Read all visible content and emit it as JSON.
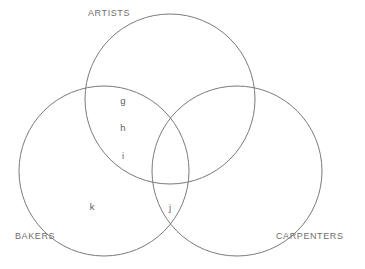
{
  "diagram": {
    "type": "venn-3-set",
    "background_color": "#ffffff",
    "stroke_color": "#7a7a7a",
    "label_color": "#6f6f6f",
    "item_color": "#5d5d5d",
    "sets": [
      {
        "key": "artists",
        "label": "ARTISTS",
        "label_x": 88,
        "label_y": 9,
        "cx": 170,
        "cy": 99,
        "r": 85
      },
      {
        "key": "bakers",
        "label": "BAKERS",
        "label_x": 15,
        "label_y": 232,
        "cx": 104,
        "cy": 171,
        "r": 85
      },
      {
        "key": "carpenters",
        "label": "CARPENTERS",
        "label_x": 276,
        "label_y": 232,
        "cx": 237,
        "cy": 171,
        "r": 85
      }
    ],
    "items": [
      {
        "text": "g",
        "region": "artists-bakers",
        "x": 123,
        "y": 96
      },
      {
        "text": "h",
        "region": "artists-bakers",
        "x": 123,
        "y": 123
      },
      {
        "text": "i",
        "region": "artists-bakers",
        "x": 123,
        "y": 151
      },
      {
        "text": "k",
        "region": "bakers-only",
        "x": 92,
        "y": 202
      },
      {
        "text": "j",
        "region": "bakers-carpenters",
        "x": 170,
        "y": 203
      }
    ]
  }
}
